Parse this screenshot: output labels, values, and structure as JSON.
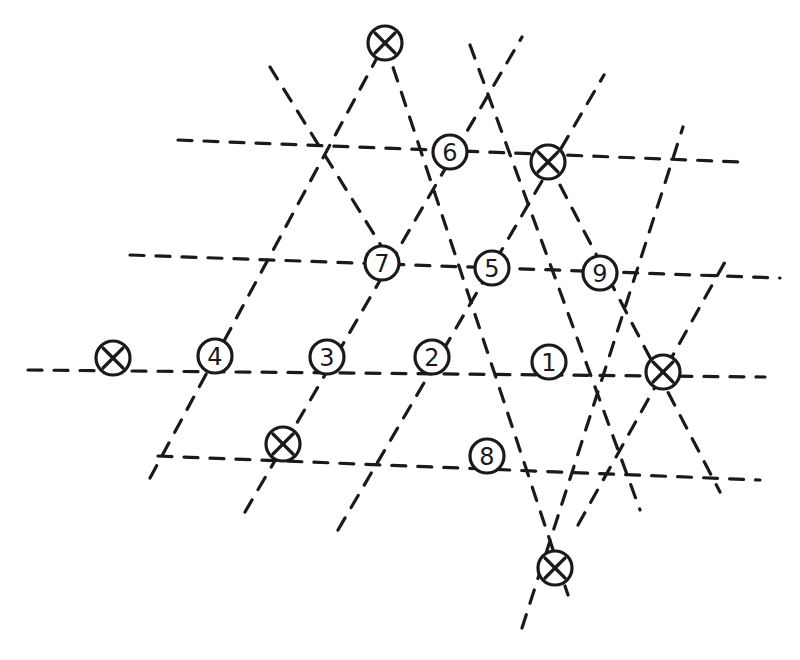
{
  "diagram": {
    "type": "hand-drawn triangular lattice",
    "colors": {
      "ink": "#1a1a1a",
      "background": "#ffffff"
    },
    "nodes": [
      {
        "id": "x-top",
        "kind": "x",
        "label": "",
        "x": 385,
        "y": 43
      },
      {
        "id": "n6",
        "kind": "number",
        "label": "6",
        "x": 450,
        "y": 152
      },
      {
        "id": "x-upper-right",
        "kind": "x",
        "label": "",
        "x": 548,
        "y": 162
      },
      {
        "id": "n7",
        "kind": "number",
        "label": "7",
        "x": 382,
        "y": 263
      },
      {
        "id": "n5",
        "kind": "number",
        "label": "5",
        "x": 492,
        "y": 268
      },
      {
        "id": "n9",
        "kind": "number",
        "label": "9",
        "x": 600,
        "y": 273
      },
      {
        "id": "x-left",
        "kind": "x",
        "label": "",
        "x": 113,
        "y": 358
      },
      {
        "id": "n4",
        "kind": "number",
        "label": "4",
        "x": 215,
        "y": 356
      },
      {
        "id": "n3",
        "kind": "number",
        "label": "3",
        "x": 327,
        "y": 357
      },
      {
        "id": "n2",
        "kind": "number",
        "label": "2",
        "x": 432,
        "y": 357
      },
      {
        "id": "n1",
        "kind": "number",
        "label": "1",
        "x": 549,
        "y": 362
      },
      {
        "id": "x-right",
        "kind": "x",
        "label": "",
        "x": 663,
        "y": 372
      },
      {
        "id": "x-lower-left",
        "kind": "x",
        "label": "",
        "x": 283,
        "y": 444
      },
      {
        "id": "n8",
        "kind": "number",
        "label": "8",
        "x": 487,
        "y": 456
      },
      {
        "id": "x-bottom",
        "kind": "x",
        "label": "",
        "x": 555,
        "y": 568
      }
    ],
    "lines": [
      {
        "name": "horizontal-row-1",
        "x1": 178,
        "y1": 140,
        "x2": 742,
        "y2": 162,
        "solid_end": true
      },
      {
        "name": "horizontal-row-2",
        "x1": 130,
        "y1": 255,
        "x2": 780,
        "y2": 278
      },
      {
        "name": "horizontal-row-3",
        "x1": 28,
        "y1": 370,
        "x2": 765,
        "y2": 377
      },
      {
        "name": "horizontal-row-4",
        "x1": 158,
        "y1": 456,
        "x2": 760,
        "y2": 480
      },
      {
        "name": "diag-up-1",
        "x1": 150,
        "y1": 478,
        "x2": 385,
        "y2": 43
      },
      {
        "name": "diag-up-2",
        "x1": 245,
        "y1": 512,
        "x2": 522,
        "y2": 37
      },
      {
        "name": "diag-up-3",
        "x1": 338,
        "y1": 530,
        "x2": 604,
        "y2": 75
      },
      {
        "name": "diag-up-4",
        "x1": 522,
        "y1": 628,
        "x2": 683,
        "y2": 127
      },
      {
        "name": "diag-up-5",
        "x1": 578,
        "y1": 525,
        "x2": 730,
        "y2": 253
      },
      {
        "name": "diag-down-1",
        "x1": 270,
        "y1": 67,
        "x2": 395,
        "y2": 268
      },
      {
        "name": "diag-down-2",
        "x1": 385,
        "y1": 43,
        "x2": 568,
        "y2": 595
      },
      {
        "name": "diag-down-3",
        "x1": 470,
        "y1": 45,
        "x2": 640,
        "y2": 510
      },
      {
        "name": "diag-down-4",
        "x1": 548,
        "y1": 162,
        "x2": 720,
        "y2": 492
      }
    ]
  }
}
